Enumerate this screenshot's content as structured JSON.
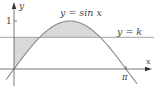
{
  "figure": {
    "curve_label": "y = sin x",
    "line_label": "y = k",
    "x_axis_label": "x",
    "y_axis_label": "y",
    "y_tick_label": "1",
    "x_tick_label": "π"
  },
  "chart_data": {
    "type": "line",
    "title": "",
    "xlabel": "x",
    "ylabel": "y",
    "series": [
      {
        "name": "y = sin x",
        "function": "sin(x)",
        "domain": [
          -0.22,
          3.45
        ]
      },
      {
        "name": "y = k",
        "function": "constant",
        "value": 0.66
      }
    ],
    "shaded_regions": [
      {
        "description": "between y = k and y = sin x, for 0 ≤ x ≤ arcsin(k)",
        "fill": "#d9d9d9"
      },
      {
        "description": "between y = sin x and y = k, for arcsin(k) ≤ x ≤ π − arcsin(k)",
        "fill": "#d9d9d9"
      }
    ],
    "x_ticks": [
      {
        "value": 3.14159,
        "label": "π"
      }
    ],
    "y_ticks": [
      {
        "value": 1,
        "label": "1"
      }
    ],
    "xlim": [
      -0.22,
      3.5
    ],
    "ylim": [
      -0.35,
      1.38
    ],
    "grid": false,
    "colors": {
      "curve": "#8a8a8a",
      "line": "#9a9a9a",
      "axis": "#555555",
      "shade": "#d9d9d9"
    }
  }
}
